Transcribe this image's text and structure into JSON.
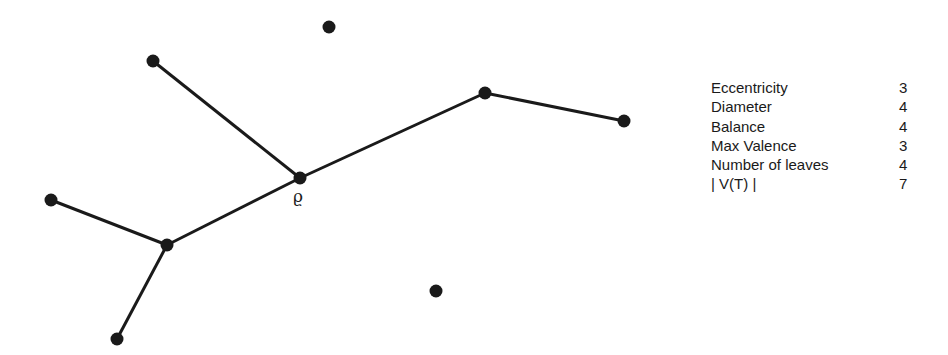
{
  "graph": {
    "nodes": [
      {
        "id": "n1",
        "x": 329,
        "y": 27
      },
      {
        "id": "n2",
        "x": 153,
        "y": 61
      },
      {
        "id": "root",
        "x": 300,
        "y": 178,
        "label": "ϱ"
      },
      {
        "id": "n4",
        "x": 485,
        "y": 93
      },
      {
        "id": "n5",
        "x": 624,
        "y": 121
      },
      {
        "id": "n6",
        "x": 51,
        "y": 200
      },
      {
        "id": "n7",
        "x": 167,
        "y": 245
      },
      {
        "id": "n8",
        "x": 117,
        "y": 339
      },
      {
        "id": "n9",
        "x": 436,
        "y": 291
      }
    ],
    "edges": [
      [
        "n2",
        "root"
      ],
      [
        "root",
        "n4"
      ],
      [
        "n4",
        "n5"
      ],
      [
        "root",
        "n7"
      ],
      [
        "n6",
        "n7"
      ],
      [
        "n7",
        "n8"
      ]
    ],
    "root_label": "ϱ"
  },
  "properties": [
    {
      "label": "Eccentricity",
      "value": "3"
    },
    {
      "label": "Diameter",
      "value": "4"
    },
    {
      "label": "Balance",
      "value": "4"
    },
    {
      "label": "Max Valence",
      "value": "3"
    },
    {
      "label": "Number of leaves",
      "value": "4"
    },
    {
      "label": "| V(T) |",
      "value": "7"
    }
  ]
}
